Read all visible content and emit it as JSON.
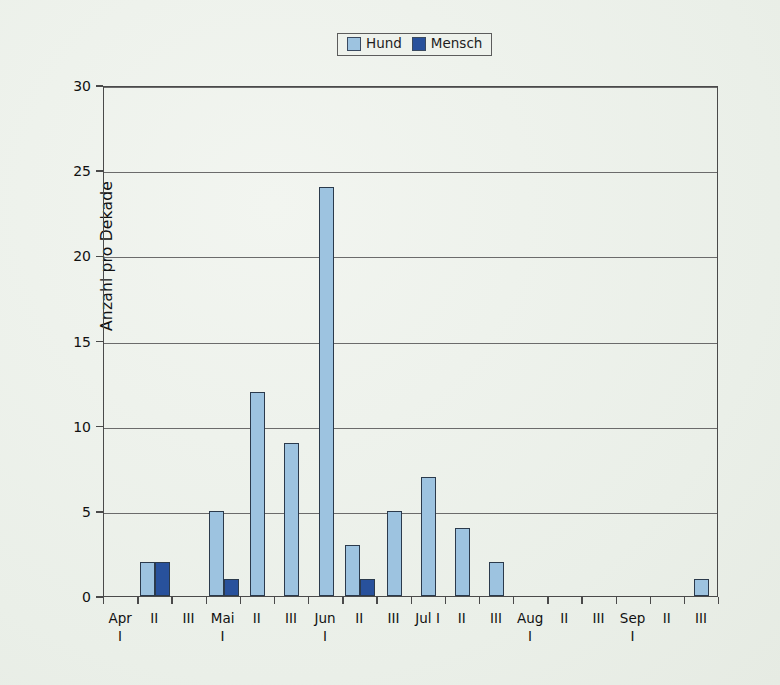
{
  "chart_data": {
    "type": "bar",
    "title": "",
    "xlabel": "",
    "ylabel": "Anzahl pro Dekade",
    "ylim": [
      0,
      30
    ],
    "yticks": [
      0,
      5,
      10,
      15,
      20,
      25,
      30
    ],
    "grid": true,
    "legend_position": "top-center",
    "categories": [
      "Apr I",
      "II",
      "III",
      "Mai I",
      "II",
      "III",
      "Jun I",
      "II",
      "III",
      "Jul I",
      "II",
      "III",
      "Aug I",
      "II",
      "III",
      "Sep I",
      "II",
      "III"
    ],
    "category_parts": [
      {
        "month": "Apr",
        "decade": "I",
        "stacked": true
      },
      {
        "month": "II",
        "decade": "",
        "stacked": false
      },
      {
        "month": "III",
        "decade": "",
        "stacked": false
      },
      {
        "month": "Mai",
        "decade": "I",
        "stacked": true
      },
      {
        "month": "II",
        "decade": "",
        "stacked": false
      },
      {
        "month": "III",
        "decade": "",
        "stacked": false
      },
      {
        "month": "Jun",
        "decade": "I",
        "stacked": true
      },
      {
        "month": "II",
        "decade": "",
        "stacked": false
      },
      {
        "month": "III",
        "decade": "",
        "stacked": false
      },
      {
        "month": "Jul I",
        "decade": "",
        "stacked": false
      },
      {
        "month": "II",
        "decade": "",
        "stacked": false
      },
      {
        "month": "III",
        "decade": "",
        "stacked": false
      },
      {
        "month": "Aug",
        "decade": "I",
        "stacked": true
      },
      {
        "month": "II",
        "decade": "",
        "stacked": false
      },
      {
        "month": "III",
        "decade": "",
        "stacked": false
      },
      {
        "month": "Sep",
        "decade": "I",
        "stacked": true
      },
      {
        "month": "II",
        "decade": "",
        "stacked": false
      },
      {
        "month": "III",
        "decade": "",
        "stacked": false
      }
    ],
    "series": [
      {
        "name": "Hund",
        "color": "#9dc3e0",
        "values": [
          0,
          2,
          0,
          5,
          12,
          9,
          24,
          3,
          5,
          7,
          4,
          2,
          0,
          0,
          0,
          0,
          0,
          1
        ]
      },
      {
        "name": "Mensch",
        "color": "#28519c",
        "values": [
          0,
          2,
          0,
          1,
          0,
          0,
          0,
          1,
          0,
          0,
          0,
          0,
          0,
          0,
          0,
          0,
          0,
          0
        ]
      }
    ]
  },
  "legend": {
    "items": [
      {
        "label": "Hund",
        "color": "#9dc3e0"
      },
      {
        "label": "Mensch",
        "color": "#28519c"
      }
    ]
  },
  "axes": {
    "y_title": "Anzahl pro Dekade",
    "y_tick_labels": [
      "0",
      "5",
      "10",
      "15",
      "20",
      "25",
      "30"
    ]
  },
  "colors": {
    "background": "#eef2ec",
    "frame": "#4a4a4a",
    "gridline": "#6b6b6b",
    "hund": "#9dc3e0",
    "mensch": "#28519c",
    "bar_outline": "#2b3a4c"
  }
}
